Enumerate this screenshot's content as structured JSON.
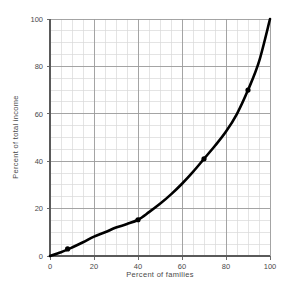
{
  "chart_data": {
    "type": "line",
    "title": "",
    "subtitle": "",
    "xlabel": "Percent of families",
    "ylabel": "Percent of total income",
    "xlim": [
      0,
      100
    ],
    "ylim": [
      0,
      100
    ],
    "xticks": [
      0,
      20,
      40,
      60,
      80,
      100
    ],
    "yticks": [
      0,
      20,
      40,
      60,
      80,
      100
    ],
    "xtick_labels": [
      "0",
      "20",
      "40",
      "60",
      "80",
      "100"
    ],
    "ytick_labels": [
      "0",
      "20",
      "40",
      "60",
      "80",
      "100"
    ],
    "grid": true,
    "grid_minor_step": 5,
    "grid_major_step": 20,
    "grid_minor_color": "#d8d8d8",
    "grid_major_color": "#9a9a9a",
    "legend": false,
    "legend_position": "none",
    "series": [
      {
        "name": "Lorenz curve",
        "color": "#000000",
        "line_width": 2.6,
        "x": [
          0,
          5,
          10,
          15,
          20,
          25,
          30,
          35,
          40,
          45,
          50,
          55,
          60,
          65,
          70,
          75,
          80,
          85,
          90,
          95,
          100
        ],
        "y": [
          0,
          1.6,
          3.6,
          5.8,
          8.2,
          10.0,
          12.0,
          13.5,
          15.3,
          18.5,
          22.0,
          26.0,
          30.5,
          35.5,
          41.0,
          46.5,
          52.5,
          60.0,
          70.0,
          82.0,
          100.0
        ]
      }
    ],
    "markers": [
      {
        "x": 8,
        "y": 3.0
      },
      {
        "x": 40,
        "y": 15.3
      },
      {
        "x": 70,
        "y": 41.0
      },
      {
        "x": 90,
        "y": 70.0
      }
    ],
    "marker_color": "#000000",
    "marker_size": 2.6
  },
  "plot_geometry": {
    "left": 50,
    "right": 270,
    "top": 19,
    "bottom": 256
  }
}
